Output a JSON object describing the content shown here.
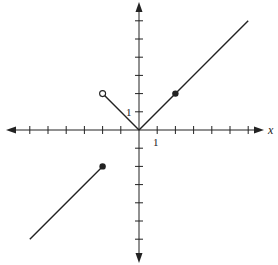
{
  "chart_data": {
    "type": "line",
    "title": "",
    "xlabel": "x",
    "ylabel": "",
    "xlim": [
      -7,
      7
    ],
    "ylim": [
      -7,
      7
    ],
    "grid": false,
    "tick_step": 1,
    "tick_labels": {
      "x": "1",
      "y": "1"
    },
    "series": [
      {
        "name": "segment-left",
        "points": [
          [
            -6,
            -6
          ],
          [
            -2,
            -2
          ]
        ],
        "endpoints": {
          "start": "none",
          "end": "closed"
        }
      },
      {
        "name": "segment-v-left",
        "points": [
          [
            -2,
            2
          ],
          [
            0,
            0
          ]
        ],
        "endpoints": {
          "start": "open",
          "end": "none"
        }
      },
      {
        "name": "segment-v-right",
        "points": [
          [
            0,
            0
          ],
          [
            6,
            6
          ]
        ],
        "endpoints": {
          "start": "none",
          "end": "none"
        }
      }
    ],
    "markers": [
      {
        "x": -2,
        "y": -2,
        "type": "closed"
      },
      {
        "x": -2,
        "y": 2,
        "type": "open"
      },
      {
        "x": 2,
        "y": 2,
        "type": "closed"
      }
    ]
  },
  "labels": {
    "x_axis": "x",
    "x_tick_one": "1",
    "y_tick_one": "1"
  },
  "colors": {
    "stroke": "#222222",
    "background": "#ffffff"
  }
}
